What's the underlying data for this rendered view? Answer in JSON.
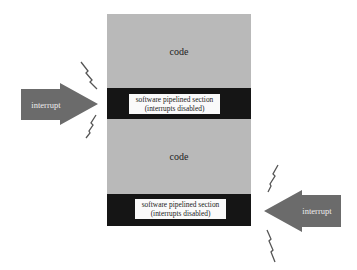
{
  "diagram": {
    "title": "",
    "colors": {
      "code_fill": "#b9b9b9",
      "band_fill": "#151515",
      "label_fill": "#fafafa",
      "arrow_fill": "#6b6b6b",
      "bolt_stroke": "#555555"
    },
    "stack": {
      "regions": [
        {
          "type": "code",
          "label": "code"
        },
        {
          "type": "band",
          "label_line1": "software pipelined section",
          "label_line2": "(interrupts disabled)"
        },
        {
          "type": "code",
          "label": "code"
        },
        {
          "type": "band",
          "label_line1": "software pipelined section",
          "label_line2": "(interrupts disabled)"
        }
      ]
    },
    "arrows": [
      {
        "direction": "right",
        "label": "interrupt",
        "target": "first pipelined section"
      },
      {
        "direction": "left",
        "label": "interrupt",
        "target": "second pipelined section"
      }
    ],
    "bolts": [
      {
        "position": "upper-left"
      },
      {
        "position": "lower-left"
      },
      {
        "position": "upper-right"
      },
      {
        "position": "lower-right"
      }
    ]
  }
}
